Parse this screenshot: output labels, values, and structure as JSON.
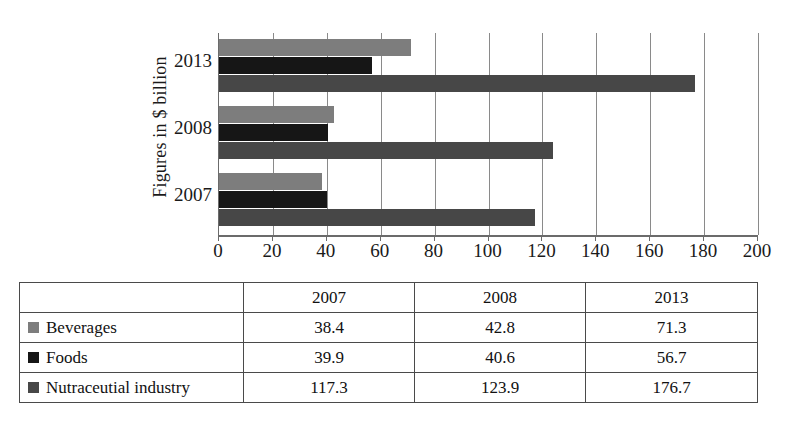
{
  "chart_data": {
    "type": "bar",
    "orientation": "horizontal",
    "title": "",
    "xlabel": "",
    "ylabel": "Figures in $ billion",
    "categories": [
      "2007",
      "2008",
      "2013"
    ],
    "category_order_top_to_bottom": [
      "2013",
      "2008",
      "2007"
    ],
    "series": [
      {
        "name": "Beverages",
        "color": "#7d7d7d",
        "values": [
          38.4,
          42.8,
          71.3
        ]
      },
      {
        "name": "Foods",
        "color": "#161616",
        "values": [
          39.9,
          40.6,
          56.7
        ]
      },
      {
        "name": "Nutraceutial industry",
        "color": "#474747",
        "values": [
          117.3,
          123.9,
          176.7
        ]
      }
    ],
    "xlim": [
      0,
      200
    ],
    "xticks": [
      0,
      20,
      40,
      60,
      80,
      100,
      120,
      140,
      160,
      180,
      200
    ],
    "xtick_labels": [
      "0",
      "20",
      "40",
      "60",
      "80",
      "100",
      "120",
      "140",
      "160",
      "180",
      "200"
    ],
    "grid": true,
    "grid_axis": "x",
    "legend_position": "table-below"
  },
  "axis": {
    "y_title": "Figures in $ billion",
    "tick_labels": [
      "0",
      "20",
      "40",
      "60",
      "80",
      "100",
      "120",
      "140",
      "160",
      "180",
      "200"
    ],
    "category_labels": [
      "2013",
      "2008",
      "2007"
    ]
  },
  "table": {
    "corner_label": "",
    "headers": [
      "2007",
      "2008",
      "2013"
    ],
    "rows": [
      {
        "label": "Beverages",
        "swatch": "beverages-swatch",
        "values": [
          "38.4",
          "42.8",
          "71.3"
        ]
      },
      {
        "label": "Foods",
        "swatch": "foods-swatch",
        "values": [
          "39.9",
          "40.6",
          "56.7"
        ]
      },
      {
        "label": "Nutraceutial industry",
        "swatch": "nutra-swatch",
        "values": [
          "117.3",
          "123.9",
          "176.7"
        ]
      }
    ]
  },
  "colors": {
    "beverages": "#7d7d7d",
    "foods": "#161616",
    "nutraceutical": "#474747",
    "grid": "#8a8a8a",
    "axis": "#6b6b6b",
    "text": "#111111",
    "background": "#ffffff"
  }
}
